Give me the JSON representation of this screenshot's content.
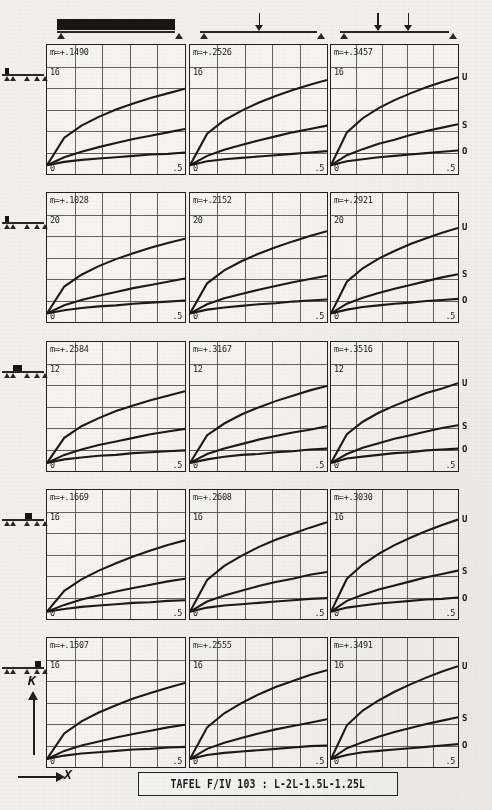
{
  "sheet": {
    "caption": "TAFEL F/IV 103 : L-2L-1.5L-1.25L",
    "y_axis_glyph": "K",
    "x_axis_glyph": "X"
  },
  "curve_tags": [
    {
      "label": "U"
    },
    {
      "label": "S"
    },
    {
      "label": "O"
    }
  ],
  "column_headers": [
    {
      "name": "uniform-distributed-load",
      "load_type": "udl",
      "point_loads": []
    },
    {
      "name": "single-point-load-midspan",
      "load_type": "point",
      "point_loads": [
        0.5
      ]
    },
    {
      "name": "two-point-loads-thirds",
      "load_type": "point",
      "point_loads": [
        0.34,
        0.62
      ]
    }
  ],
  "row_headers": [
    {
      "name": "beam-spans-L-2L-1.5L-1.25L-load-span-1",
      "loaded_span": 1
    },
    {
      "name": "beam-spans-L-2L-1.5L-1.25L-load-span-1b",
      "loaded_span": 1
    },
    {
      "name": "beam-spans-L-2L-1.5L-1.25L-load-span-2",
      "loaded_span": 2
    },
    {
      "name": "beam-spans-L-2L-1.5L-1.25L-load-span-3",
      "loaded_span": 3
    },
    {
      "name": "beam-spans-L-2L-1.5L-1.25L-load-span-4",
      "loaded_span": 4
    }
  ],
  "chart_data": [
    {
      "type": "line",
      "title": "m=+.1490",
      "m_value": "m=+.1490",
      "xlabel": "X",
      "ylabel": "K",
      "xlim": [
        0,
        0.5
      ],
      "ylim": [
        0,
        16
      ],
      "x_ticks": [
        "0",
        ".5"
      ],
      "y_ticks": [
        "16"
      ],
      "grid": true,
      "x": [
        0,
        0.0625,
        0.125,
        0.1875,
        0.25,
        0.3125,
        0.375,
        0.4375,
        0.5
      ],
      "series": [
        {
          "name": "U",
          "values": [
            1.3,
            5.4,
            7.2,
            8.5,
            9.6,
            10.5,
            11.3,
            12.0,
            12.7
          ]
        },
        {
          "name": "S",
          "values": [
            1.3,
            2.5,
            3.3,
            4.0,
            4.6,
            5.2,
            5.7,
            6.2,
            6.7
          ]
        },
        {
          "name": "O",
          "values": [
            1.3,
            1.8,
            2.1,
            2.3,
            2.5,
            2.7,
            2.9,
            3.0,
            3.2
          ]
        }
      ]
    },
    {
      "type": "line",
      "title": "m=+.2526",
      "m_value": "m=+.2526",
      "xlabel": "X",
      "ylabel": "K",
      "xlim": [
        0,
        0.5
      ],
      "ylim": [
        0,
        16
      ],
      "x_ticks": [
        "0",
        ".5"
      ],
      "y_ticks": [
        "16"
      ],
      "grid": true,
      "x": [
        0,
        0.0625,
        0.125,
        0.1875,
        0.25,
        0.3125,
        0.375,
        0.4375,
        0.5
      ],
      "series": [
        {
          "name": "U",
          "values": [
            1.3,
            6.0,
            8.0,
            9.4,
            10.6,
            11.6,
            12.5,
            13.3,
            14.0
          ]
        },
        {
          "name": "S",
          "values": [
            1.3,
            2.7,
            3.6,
            4.3,
            5.0,
            5.6,
            6.2,
            6.7,
            7.2
          ]
        },
        {
          "name": "O",
          "values": [
            1.3,
            1.9,
            2.2,
            2.4,
            2.6,
            2.8,
            3.0,
            3.2,
            3.4
          ]
        }
      ]
    },
    {
      "type": "line",
      "title": "m=+.3457",
      "m_value": "m=+.3457",
      "xlabel": "X",
      "ylabel": "K",
      "xlim": [
        0,
        0.5
      ],
      "ylim": [
        0,
        16
      ],
      "x_ticks": [
        "0",
        ".5"
      ],
      "y_ticks": [
        "16"
      ],
      "grid": true,
      "x": [
        0,
        0.0625,
        0.125,
        0.1875,
        0.25,
        0.3125,
        0.375,
        0.4375,
        0.5
      ],
      "series": [
        {
          "name": "U",
          "values": [
            1.3,
            6.2,
            8.3,
            9.8,
            11.0,
            12.0,
            12.9,
            13.7,
            14.4
          ]
        },
        {
          "name": "S",
          "values": [
            1.3,
            2.8,
            3.7,
            4.5,
            5.1,
            5.8,
            6.4,
            6.9,
            7.4
          ]
        },
        {
          "name": "O",
          "values": [
            1.3,
            1.9,
            2.2,
            2.5,
            2.7,
            2.9,
            3.1,
            3.3,
            3.5
          ]
        }
      ]
    },
    {
      "type": "line",
      "title": "m=+.1028",
      "m_value": "m=+.1028",
      "xlabel": "X",
      "ylabel": "K",
      "xlim": [
        0,
        0.5
      ],
      "ylim": [
        0,
        20
      ],
      "x_ticks": [
        "0",
        ".5"
      ],
      "y_ticks": [
        "20"
      ],
      "grid": true,
      "x": [
        0,
        0.0625,
        0.125,
        0.1875,
        0.25,
        0.3125,
        0.375,
        0.4375,
        0.5
      ],
      "series": [
        {
          "name": "U",
          "values": [
            1.6,
            6.6,
            8.8,
            10.4,
            11.7,
            12.8,
            13.8,
            14.7,
            15.5
          ]
        },
        {
          "name": "S",
          "values": [
            1.6,
            3.1,
            4.1,
            4.9,
            5.6,
            6.3,
            6.9,
            7.5,
            8.1
          ]
        },
        {
          "name": "O",
          "values": [
            1.6,
            2.2,
            2.6,
            2.9,
            3.1,
            3.4,
            3.6,
            3.8,
            4.0
          ]
        }
      ]
    },
    {
      "type": "line",
      "title": "m=+.2152",
      "m_value": "m=+.2152",
      "xlabel": "X",
      "ylabel": "K",
      "xlim": [
        0,
        0.5
      ],
      "ylim": [
        0,
        20
      ],
      "x_ticks": [
        "0",
        ".5"
      ],
      "y_ticks": [
        "20"
      ],
      "grid": true,
      "x": [
        0,
        0.0625,
        0.125,
        0.1875,
        0.25,
        0.3125,
        0.375,
        0.4375,
        0.5
      ],
      "series": [
        {
          "name": "U",
          "values": [
            1.6,
            7.2,
            9.6,
            11.3,
            12.7,
            13.9,
            15.0,
            16.0,
            16.9
          ]
        },
        {
          "name": "S",
          "values": [
            1.6,
            3.3,
            4.4,
            5.2,
            6.0,
            6.7,
            7.4,
            8.0,
            8.6
          ]
        },
        {
          "name": "O",
          "values": [
            1.6,
            2.3,
            2.7,
            3.0,
            3.3,
            3.5,
            3.8,
            4.0,
            4.2
          ]
        }
      ]
    },
    {
      "type": "line",
      "title": "m=+.2921",
      "m_value": "m=+.2921",
      "xlabel": "X",
      "ylabel": "K",
      "xlim": [
        0,
        0.5
      ],
      "ylim": [
        0,
        20
      ],
      "x_ticks": [
        "0",
        ".5"
      ],
      "y_ticks": [
        "20"
      ],
      "grid": true,
      "x": [
        0,
        0.0625,
        0.125,
        0.1875,
        0.25,
        0.3125,
        0.375,
        0.4375,
        0.5
      ],
      "series": [
        {
          "name": "U",
          "values": [
            1.6,
            7.5,
            10.0,
            11.8,
            13.2,
            14.5,
            15.6,
            16.6,
            17.5
          ]
        },
        {
          "name": "S",
          "values": [
            1.6,
            3.4,
            4.5,
            5.4,
            6.2,
            6.9,
            7.6,
            8.3,
            8.9
          ]
        },
        {
          "name": "O",
          "values": [
            1.6,
            2.3,
            2.8,
            3.1,
            3.4,
            3.6,
            3.9,
            4.1,
            4.3
          ]
        }
      ]
    },
    {
      "type": "line",
      "title": "m=+.2584",
      "m_value": "m=+.2584",
      "xlabel": "X",
      "ylabel": "K",
      "xlim": [
        0,
        0.5
      ],
      "ylim": [
        0,
        12
      ],
      "x_ticks": [
        "0",
        ".5"
      ],
      "y_ticks": [
        "12"
      ],
      "grid": true,
      "x": [
        0,
        0.0625,
        0.125,
        0.1875,
        0.25,
        0.3125,
        0.375,
        0.4375,
        0.5
      ],
      "series": [
        {
          "name": "U",
          "values": [
            0.9,
            3.7,
            5.0,
            5.9,
            6.7,
            7.3,
            7.9,
            8.4,
            8.9
          ]
        },
        {
          "name": "S",
          "values": [
            0.9,
            1.8,
            2.4,
            2.9,
            3.3,
            3.7,
            4.1,
            4.4,
            4.7
          ]
        },
        {
          "name": "O",
          "values": [
            0.9,
            1.3,
            1.5,
            1.7,
            1.8,
            2.0,
            2.1,
            2.2,
            2.3
          ]
        }
      ]
    },
    {
      "type": "line",
      "title": "m=+.3167",
      "m_value": "m=+.3167",
      "xlabel": "X",
      "ylabel": "K",
      "xlim": [
        0,
        0.5
      ],
      "ylim": [
        0,
        12
      ],
      "x_ticks": [
        "0",
        ".5"
      ],
      "y_ticks": [
        "12"
      ],
      "grid": true,
      "x": [
        0,
        0.0625,
        0.125,
        0.1875,
        0.25,
        0.3125,
        0.375,
        0.4375,
        0.5
      ],
      "series": [
        {
          "name": "U",
          "values": [
            0.9,
            4.0,
            5.3,
            6.3,
            7.1,
            7.8,
            8.4,
            9.0,
            9.5
          ]
        },
        {
          "name": "S",
          "values": [
            0.9,
            1.9,
            2.5,
            3.0,
            3.5,
            3.9,
            4.3,
            4.6,
            5.0
          ]
        },
        {
          "name": "O",
          "values": [
            0.9,
            1.3,
            1.6,
            1.8,
            1.9,
            2.1,
            2.2,
            2.4,
            2.5
          ]
        }
      ]
    },
    {
      "type": "line",
      "title": "m=+.3516",
      "m_value": "m=+.3516",
      "xlabel": "X",
      "ylabel": "K",
      "xlim": [
        0,
        0.5
      ],
      "ylim": [
        0,
        12
      ],
      "x_ticks": [
        "0",
        ".5"
      ],
      "y_ticks": [
        "12"
      ],
      "grid": true,
      "x": [
        0,
        0.0625,
        0.125,
        0.1875,
        0.25,
        0.3125,
        0.375,
        0.4375,
        0.5
      ],
      "series": [
        {
          "name": "U",
          "values": [
            0.9,
            4.1,
            5.5,
            6.5,
            7.3,
            8.0,
            8.7,
            9.2,
            9.8
          ]
        },
        {
          "name": "S",
          "values": [
            0.9,
            1.9,
            2.6,
            3.1,
            3.6,
            4.0,
            4.4,
            4.8,
            5.1
          ]
        },
        {
          "name": "O",
          "values": [
            0.9,
            1.4,
            1.6,
            1.8,
            2.0,
            2.1,
            2.3,
            2.4,
            2.5
          ]
        }
      ]
    },
    {
      "type": "line",
      "title": "m=+.1669",
      "m_value": "m=+.1669",
      "xlabel": "X",
      "ylabel": "K",
      "xlim": [
        0,
        0.5
      ],
      "ylim": [
        0,
        16
      ],
      "x_ticks": [
        "0",
        ".5"
      ],
      "y_ticks": [
        "16"
      ],
      "grid": true,
      "x": [
        0,
        0.0625,
        0.125,
        0.1875,
        0.25,
        0.3125,
        0.375,
        0.4375,
        0.5
      ],
      "series": [
        {
          "name": "U",
          "values": [
            1.1,
            4.2,
            5.9,
            7.2,
            8.3,
            9.3,
            10.2,
            11.0,
            11.7
          ]
        },
        {
          "name": "S",
          "values": [
            1.1,
            2.1,
            2.9,
            3.5,
            4.1,
            4.6,
            5.1,
            5.6,
            6.0
          ]
        },
        {
          "name": "O",
          "values": [
            1.1,
            1.5,
            1.8,
            2.0,
            2.2,
            2.4,
            2.5,
            2.7,
            2.8
          ]
        }
      ]
    },
    {
      "type": "line",
      "title": "m=+.2608",
      "m_value": "m=+.2608",
      "xlabel": "X",
      "ylabel": "K",
      "xlim": [
        0,
        0.5
      ],
      "ylim": [
        0,
        16
      ],
      "x_ticks": [
        "0",
        ".5"
      ],
      "y_ticks": [
        "16"
      ],
      "grid": true,
      "x": [
        0,
        0.0625,
        0.125,
        0.1875,
        0.25,
        0.3125,
        0.375,
        0.4375,
        0.5
      ],
      "series": [
        {
          "name": "U",
          "values": [
            1.1,
            5.8,
            7.9,
            9.4,
            10.7,
            11.8,
            12.7,
            13.6,
            14.4
          ]
        },
        {
          "name": "S",
          "values": [
            1.1,
            2.6,
            3.5,
            4.2,
            4.9,
            5.5,
            6.0,
            6.6,
            7.0
          ]
        },
        {
          "name": "O",
          "values": [
            1.1,
            1.7,
            2.0,
            2.2,
            2.4,
            2.6,
            2.8,
            3.0,
            3.1
          ]
        }
      ]
    },
    {
      "type": "line",
      "title": "m=+.3030",
      "m_value": "m=+.3030",
      "xlabel": "X",
      "ylabel": "K",
      "xlim": [
        0,
        0.5
      ],
      "ylim": [
        0,
        16
      ],
      "x_ticks": [
        "0",
        ".5"
      ],
      "y_ticks": [
        "16"
      ],
      "grid": true,
      "x": [
        0,
        0.0625,
        0.125,
        0.1875,
        0.25,
        0.3125,
        0.375,
        0.4375,
        0.5
      ],
      "series": [
        {
          "name": "U",
          "values": [
            1.1,
            6.0,
            8.1,
            9.7,
            11.0,
            12.1,
            13.1,
            14.0,
            14.8
          ]
        },
        {
          "name": "S",
          "values": [
            1.1,
            2.7,
            3.6,
            4.4,
            5.0,
            5.6,
            6.2,
            6.7,
            7.2
          ]
        },
        {
          "name": "O",
          "values": [
            1.1,
            1.7,
            2.0,
            2.3,
            2.5,
            2.7,
            2.9,
            3.0,
            3.2
          ]
        }
      ]
    },
    {
      "type": "line",
      "title": "m=+.1507",
      "m_value": "m=+.1507",
      "xlabel": "X",
      "ylabel": "K",
      "xlim": [
        0,
        0.5
      ],
      "ylim": [
        0,
        16
      ],
      "x_ticks": [
        "0",
        ".5"
      ],
      "y_ticks": [
        "16"
      ],
      "grid": true,
      "x": [
        0,
        0.0625,
        0.125,
        0.1875,
        0.25,
        0.3125,
        0.375,
        0.4375,
        0.5
      ],
      "series": [
        {
          "name": "U",
          "values": [
            1.2,
            5.0,
            6.8,
            8.1,
            9.2,
            10.2,
            11.0,
            11.8,
            12.5
          ]
        },
        {
          "name": "S",
          "values": [
            1.2,
            2.4,
            3.2,
            3.8,
            4.4,
            4.9,
            5.4,
            5.9,
            6.3
          ]
        },
        {
          "name": "O",
          "values": [
            1.2,
            1.7,
            2.0,
            2.2,
            2.4,
            2.6,
            2.7,
            2.9,
            3.0
          ]
        }
      ]
    },
    {
      "type": "line",
      "title": "m=+.2555",
      "m_value": "m=+.2555",
      "xlabel": "X",
      "ylabel": "K",
      "xlim": [
        0,
        0.5
      ],
      "ylim": [
        0,
        16
      ],
      "x_ticks": [
        "0",
        ".5"
      ],
      "y_ticks": [
        "16"
      ],
      "grid": true,
      "x": [
        0,
        0.0625,
        0.125,
        0.1875,
        0.25,
        0.3125,
        0.375,
        0.4375,
        0.5
      ],
      "series": [
        {
          "name": "U",
          "values": [
            1.2,
            5.9,
            8.0,
            9.5,
            10.8,
            11.9,
            12.8,
            13.7,
            14.4
          ]
        },
        {
          "name": "S",
          "values": [
            1.2,
            2.7,
            3.6,
            4.3,
            5.0,
            5.6,
            6.1,
            6.6,
            7.1
          ]
        },
        {
          "name": "O",
          "values": [
            1.2,
            1.8,
            2.1,
            2.3,
            2.5,
            2.7,
            2.9,
            3.1,
            3.2
          ]
        }
      ]
    },
    {
      "type": "line",
      "title": "m=+.3491",
      "m_value": "m=+.3491",
      "xlabel": "X",
      "ylabel": "K",
      "xlim": [
        0,
        0.5
      ],
      "ylim": [
        0,
        16
      ],
      "x_ticks": [
        "0",
        ".5"
      ],
      "y_ticks": [
        "16"
      ],
      "grid": true,
      "x": [
        0,
        0.0625,
        0.125,
        0.1875,
        0.25,
        0.3125,
        0.375,
        0.4375,
        0.5
      ],
      "series": [
        {
          "name": "U",
          "values": [
            1.2,
            6.2,
            8.4,
            9.9,
            11.2,
            12.3,
            13.3,
            14.2,
            15.0
          ]
        },
        {
          "name": "S",
          "values": [
            1.2,
            2.8,
            3.7,
            4.5,
            5.2,
            5.8,
            6.4,
            6.9,
            7.4
          ]
        },
        {
          "name": "O",
          "values": [
            1.2,
            1.8,
            2.2,
            2.4,
            2.6,
            2.8,
            3.0,
            3.2,
            3.4
          ]
        }
      ]
    }
  ]
}
